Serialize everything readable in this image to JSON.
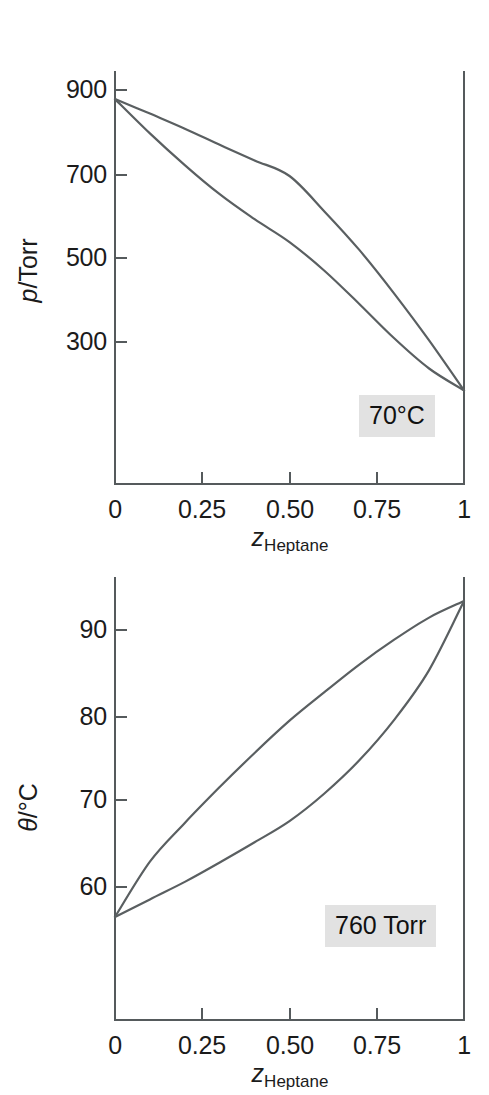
{
  "figure": {
    "caption_absent": true
  },
  "charts": [
    {
      "id": "pressure-composition",
      "badge": "70°C",
      "y_axis_title_var": "p",
      "y_axis_title_unit": "/Torr",
      "x_axis_title_var": "z",
      "x_axis_title_sub": "Heptane",
      "y_ticks": [
        "900",
        "700",
        "500",
        "300"
      ],
      "x_ticks": [
        "0",
        "0.25",
        "0.50",
        "0.75",
        "1"
      ]
    },
    {
      "id": "temperature-composition",
      "badge": "760 Torr",
      "y_axis_title_var": "θ",
      "y_axis_title_unit": "/°C",
      "x_axis_title_var": "z",
      "x_axis_title_sub": "Heptane",
      "y_ticks": [
        "90",
        "80",
        "70",
        "60"
      ],
      "x_ticks": [
        "0",
        "0.25",
        "0.50",
        "0.75",
        "1"
      ]
    }
  ],
  "chart_data": [
    {
      "type": "line",
      "id": "pressure-composition",
      "title": "",
      "xlabel": "z_Heptane",
      "ylabel": "p/Torr",
      "xlim": [
        0,
        1
      ],
      "ylim": [
        160,
        952
      ],
      "xticks": [
        0,
        0.25,
        0.5,
        0.75,
        1
      ],
      "xticklabels": [
        "0",
        "0.25",
        "0.50",
        "0.75",
        "1"
      ],
      "yticks": [
        900,
        700,
        500,
        300
      ],
      "yticklabels": [
        "900",
        "700",
        "500",
        "300"
      ],
      "grid": false,
      "legend": false,
      "annotations": [
        {
          "text": "70°C",
          "x": 0.88,
          "y": 225,
          "style": "gray-box"
        }
      ],
      "series": [
        {
          "name": "liquid (bubble) line",
          "x": [
            0,
            0.1,
            0.2,
            0.3,
            0.4,
            0.5,
            0.6,
            0.7,
            0.8,
            0.9,
            1
          ],
          "y": [
            900,
            872,
            843,
            812,
            782,
            752,
            684,
            610,
            526,
            436,
            340
          ]
        },
        {
          "name": "vapour (dew) line",
          "x": [
            0,
            0.1,
            0.2,
            0.3,
            0.4,
            0.5,
            0.6,
            0.7,
            0.8,
            0.9,
            1
          ],
          "y": [
            900,
            834,
            773,
            717,
            669,
            625,
            570,
            506,
            440,
            382,
            340
          ]
        }
      ]
    },
    {
      "type": "line",
      "id": "temperature-composition",
      "title": "",
      "xlabel": "z_Heptane",
      "ylabel": "θ/°C",
      "xlim": [
        0,
        1
      ],
      "ylim": [
        53,
        101
      ],
      "xticks": [
        0,
        0.25,
        0.5,
        0.75,
        1
      ],
      "xticklabels": [
        "0",
        "0.25",
        "0.50",
        "0.75",
        "1"
      ],
      "yticks": [
        90,
        80,
        70,
        60
      ],
      "yticklabels": [
        "90",
        "80",
        "70",
        "60"
      ],
      "grid": false,
      "legend": false,
      "annotations": [
        {
          "text": "760 Torr",
          "x": 0.72,
          "y": 58.5,
          "style": "gray-box"
        }
      ],
      "series": [
        {
          "name": "vapour (dew) line",
          "x": [
            0,
            0.1,
            0.2,
            0.3,
            0.4,
            0.5,
            0.6,
            0.7,
            0.8,
            0.9,
            1
          ],
          "y": [
            64.2,
            70.2,
            74.4,
            78.3,
            82.0,
            85.5,
            88.6,
            91.6,
            94.3,
            96.7,
            98.5
          ]
        },
        {
          "name": "liquid (bubble) line",
          "x": [
            0,
            0.1,
            0.2,
            0.3,
            0.4,
            0.5,
            0.6,
            0.7,
            0.8,
            0.9,
            1
          ],
          "y": [
            64.2,
            66.1,
            68.0,
            70.1,
            72.3,
            74.6,
            77.6,
            81.2,
            85.6,
            91.0,
            98.5
          ]
        }
      ]
    }
  ]
}
